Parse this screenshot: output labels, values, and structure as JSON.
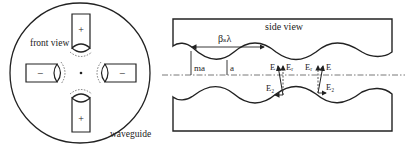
{
  "front_view": {
    "label": "front view",
    "waveguide_label": "waveguide",
    "vanes": [
      {
        "position": "top",
        "sign": "+"
      },
      {
        "position": "bottom",
        "sign": "+"
      },
      {
        "position": "left",
        "sign": "−"
      },
      {
        "position": "right",
        "sign": "−"
      }
    ]
  },
  "side_view": {
    "label": "side view",
    "period_label": "βₛλ",
    "max_aperture_label": "ma",
    "min_aperture_label": "a",
    "field_labels": {
      "left": {
        "E": "E",
        "Er": "Eᵣ",
        "Ez": "E₂"
      },
      "right": {
        "E": "E",
        "Er": "Eᵣ",
        "Ez": "E₂"
      }
    }
  },
  "colors": {
    "line": "#222222",
    "dashed": "#555555",
    "background": "#ffffff"
  }
}
